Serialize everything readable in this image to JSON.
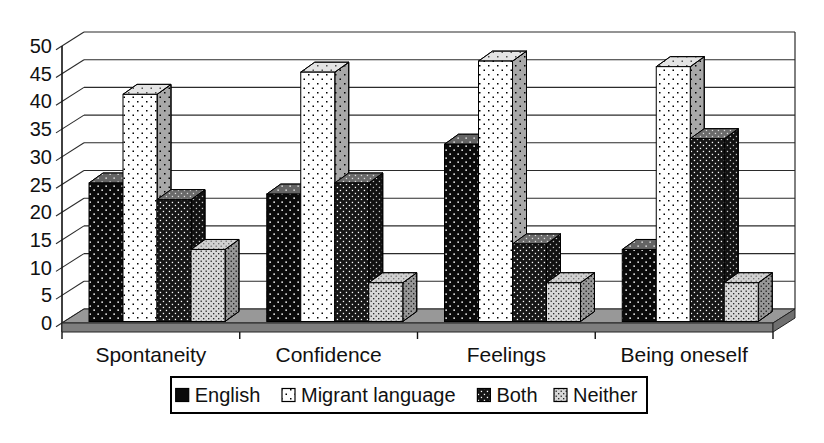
{
  "chart_data": {
    "type": "bar",
    "style": "3d-clustered-bar",
    "title": "",
    "xlabel": "",
    "ylabel": "",
    "categories": [
      "Spontaneity",
      "Confidence",
      "Feelings",
      "Being oneself"
    ],
    "series": [
      {
        "name": "English",
        "values": [
          25,
          23,
          32,
          13
        ]
      },
      {
        "name": "Migrant language",
        "values": [
          41,
          45,
          47,
          46
        ]
      },
      {
        "name": "Both",
        "values": [
          22,
          25,
          14,
          33
        ]
      },
      {
        "name": "Neither",
        "values": [
          13,
          7,
          7,
          7
        ]
      }
    ],
    "ylim": [
      0,
      50
    ],
    "ytick_step": 5,
    "yticks": [
      0,
      5,
      10,
      15,
      20,
      25,
      30,
      35,
      40,
      45,
      50
    ],
    "grid": true,
    "legend_position": "bottom"
  },
  "colors": {
    "background": "#ffffff",
    "gridline": "#2b2b2b",
    "english_fill": "#0a0a0a",
    "english_dot": "#ffffff",
    "migrant_fill": "#ffffff",
    "migrant_dot": "#000000",
    "both_fill": "#161616",
    "both_dot": "#ffffff",
    "neither_fill": "#d8d8d8",
    "neither_dot": "#000000",
    "floor_top": "#989898",
    "floor_front": "#7e7e7e",
    "floor_side": "#6f6f6f"
  }
}
